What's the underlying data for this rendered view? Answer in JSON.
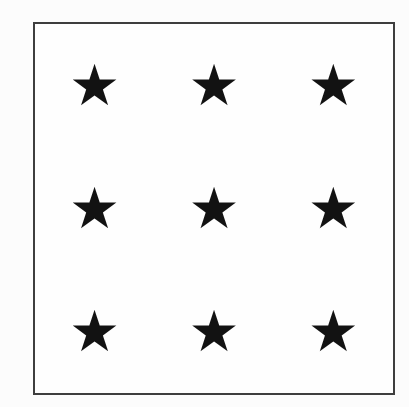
{
  "figure": {
    "star_glyph": "★",
    "grid": {
      "rows": 3,
      "cols": 3,
      "star_count": 9
    }
  },
  "theme": {
    "star-color": "#121212",
    "border-color": "#3e3e3e",
    "canvas-bg": "#fcfcfc",
    "box-bg": "#fefefe"
  }
}
